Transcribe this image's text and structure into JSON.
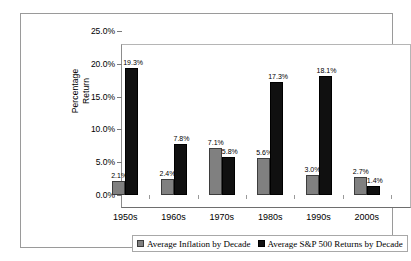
{
  "chart_data": {
    "type": "bar",
    "title": "",
    "xlabel": "",
    "ylabel": "Percentage Return",
    "ylabel_lines": [
      "Percentage",
      "Return"
    ],
    "ylim": [
      0,
      25
    ],
    "ytick_labels": [
      "0.0%",
      "5.0%",
      "10.0%",
      "15.0%",
      "20.0%",
      "25.0%"
    ],
    "ytick_values": [
      0,
      5,
      10,
      15,
      20,
      25
    ],
    "grid": false,
    "legend_position": "bottom",
    "categories": [
      "1950s",
      "1960s",
      "1970s",
      "1980s",
      "1990s",
      "2000s"
    ],
    "series": [
      {
        "name": "Average Inflation by Decade",
        "color": "#808080",
        "values": [
          2.1,
          2.4,
          7.1,
          5.6,
          3.0,
          2.7
        ],
        "labels": [
          "2.1%",
          "2.4%",
          "7.1%",
          "5.6%",
          "3.0%",
          "2.7%"
        ]
      },
      {
        "name": "Average S&P 500 Returns by Decade",
        "color": "#101010",
        "values": [
          19.3,
          7.8,
          5.8,
          17.3,
          18.1,
          1.4
        ],
        "labels": [
          "19.3%",
          "7.8%",
          "5.8%",
          "17.3%",
          "18.1%",
          "1.4%"
        ]
      }
    ]
  },
  "legend": {
    "items": [
      {
        "label": "Average Inflation  by Decade"
      },
      {
        "label": "Average S&P 500 Returns by Decade"
      }
    ]
  }
}
